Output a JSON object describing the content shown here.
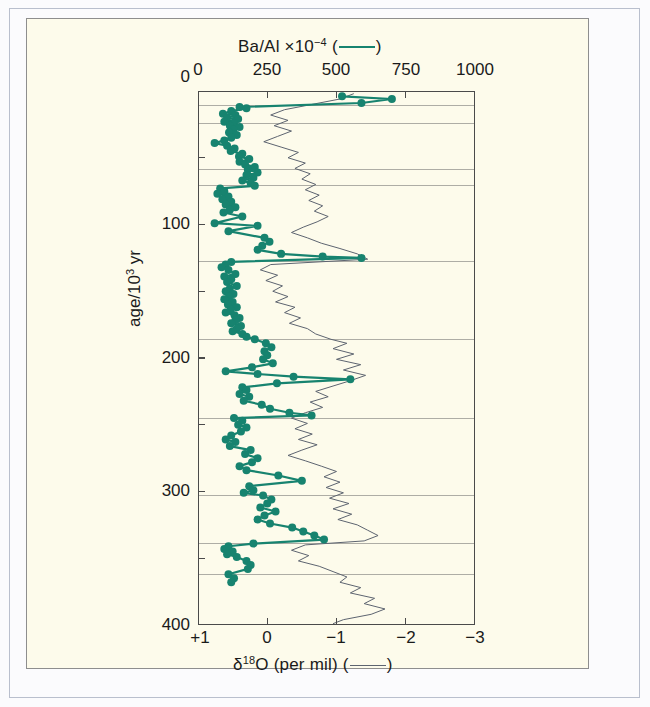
{
  "figure": {
    "background_color": "#fdfbeb",
    "series_color_ba": "#17836f",
    "series_color_d18o": "#5d6470"
  },
  "chart_data": {
    "type": "line",
    "title": "",
    "orientation": "vertical-depth-profile",
    "ylabel": "age/10³ yr",
    "ylim": [
      0,
      400
    ],
    "yticks": [
      0,
      100,
      200,
      300,
      400
    ],
    "yticks_minor": [
      50,
      150,
      250,
      350
    ],
    "ytick_labels": [
      "0",
      "100",
      "200",
      "300",
      "400"
    ],
    "y_inverted": true,
    "grid": "horizontal stage-boundary rules only",
    "legend_position": "axis captions",
    "top_axis": {
      "label_text": "Ba/Al ×10",
      "label_exponent": "−4",
      "label_suffix": "(",
      "label_suffix_end": ")",
      "legend_marker": "teal-line",
      "xlim": [
        0,
        1000
      ],
      "xticks": [
        0,
        250,
        500,
        750,
        1000
      ],
      "xtick_labels": [
        "0",
        "250",
        "500",
        "750",
        "1000"
      ]
    },
    "bottom_axis": {
      "label_delta": "δ",
      "label_exponent": "18",
      "label_element": "O",
      "label_units": "(per mil)",
      "label_suffix": "(",
      "label_suffix_end": ")",
      "legend_marker": "gray-line",
      "xlim": [
        1,
        -3
      ],
      "xticks": [
        1,
        0,
        -1,
        -2,
        -3
      ],
      "xtick_labels": [
        "+1",
        "0",
        "−1",
        "−2",
        "−3"
      ]
    },
    "stage_boundaries_kyr": [
      11,
      24,
      59,
      71,
      128,
      186,
      245,
      303,
      339,
      362
    ],
    "series": [
      {
        "name": "Ba/Al ×10⁻⁴",
        "axis": "top",
        "color": "#17836f",
        "marker": "filled-circle",
        "points": [
          [
            520,
            4
          ],
          [
            700,
            6
          ],
          [
            590,
            9
          ],
          [
            150,
            12
          ],
          [
            175,
            13
          ],
          [
            120,
            15
          ],
          [
            90,
            17
          ],
          [
            135,
            18
          ],
          [
            105,
            20
          ],
          [
            145,
            21
          ],
          [
            95,
            23
          ],
          [
            130,
            24
          ],
          [
            115,
            26
          ],
          [
            150,
            27
          ],
          [
            128,
            29
          ],
          [
            112,
            31
          ],
          [
            140,
            33
          ],
          [
            120,
            35
          ],
          [
            95,
            37
          ],
          [
            60,
            39
          ],
          [
            105,
            41
          ],
          [
            132,
            43
          ],
          [
            118,
            45
          ],
          [
            160,
            47
          ],
          [
            148,
            49
          ],
          [
            185,
            51
          ],
          [
            150,
            53
          ],
          [
            170,
            55
          ],
          [
            205,
            57
          ],
          [
            180,
            59
          ],
          [
            215,
            61
          ],
          [
            175,
            63
          ],
          [
            200,
            65
          ],
          [
            160,
            67
          ],
          [
            190,
            69
          ],
          [
            205,
            71
          ],
          [
            80,
            73
          ],
          [
            95,
            75
          ],
          [
            70,
            77
          ],
          [
            110,
            79
          ],
          [
            88,
            81
          ],
          [
            120,
            83
          ],
          [
            100,
            85
          ],
          [
            135,
            87
          ],
          [
            115,
            89
          ],
          [
            92,
            91
          ],
          [
            160,
            94
          ],
          [
            60,
            99
          ],
          [
            215,
            101
          ],
          [
            110,
            105
          ],
          [
            240,
            110
          ],
          [
            258,
            113
          ],
          [
            232,
            116
          ],
          [
            215,
            119
          ],
          [
            300,
            122
          ],
          [
            450,
            124
          ],
          [
            590,
            125
          ],
          [
            120,
            128
          ],
          [
            100,
            130
          ],
          [
            85,
            132
          ],
          [
            110,
            134
          ],
          [
            135,
            137
          ],
          [
            95,
            139
          ],
          [
            120,
            141
          ],
          [
            105,
            143
          ],
          [
            140,
            146
          ],
          [
            115,
            148
          ],
          [
            100,
            150
          ],
          [
            128,
            152
          ],
          [
            112,
            154
          ],
          [
            95,
            156
          ],
          [
            125,
            158
          ],
          [
            108,
            160
          ],
          [
            140,
            162
          ],
          [
            118,
            164
          ],
          [
            100,
            166
          ],
          [
            132,
            168
          ],
          [
            150,
            170
          ],
          [
            135,
            172
          ],
          [
            120,
            174
          ],
          [
            155,
            176
          ],
          [
            140,
            178
          ],
          [
            125,
            180
          ],
          [
            160,
            182
          ],
          [
            175,
            184
          ],
          [
            205,
            186
          ],
          [
            245,
            189
          ],
          [
            265,
            192
          ],
          [
            240,
            195
          ],
          [
            250,
            198
          ],
          [
            235,
            201
          ],
          [
            270,
            204
          ],
          [
            195,
            207
          ],
          [
            100,
            210
          ],
          [
            215,
            212
          ],
          [
            345,
            214
          ],
          [
            550,
            216
          ],
          [
            285,
            219
          ],
          [
            160,
            222
          ],
          [
            175,
            224
          ],
          [
            150,
            227
          ],
          [
            185,
            229
          ],
          [
            165,
            232
          ],
          [
            230,
            235
          ],
          [
            260,
            238
          ],
          [
            330,
            241
          ],
          [
            410,
            243
          ],
          [
            130,
            245
          ],
          [
            160,
            247
          ],
          [
            145,
            250
          ],
          [
            175,
            252
          ],
          [
            155,
            255
          ],
          [
            120,
            258
          ],
          [
            100,
            261
          ],
          [
            135,
            263
          ],
          [
            115,
            266
          ],
          [
            190,
            269
          ],
          [
            170,
            272
          ],
          [
            215,
            275
          ],
          [
            195,
            278
          ],
          [
            150,
            281
          ],
          [
            175,
            284
          ],
          [
            290,
            288
          ],
          [
            375,
            292
          ],
          [
            185,
            296
          ],
          [
            200,
            299
          ],
          [
            165,
            301
          ],
          [
            235,
            303
          ],
          [
            265,
            306
          ],
          [
            250,
            309
          ],
          [
            225,
            312
          ],
          [
            280,
            315
          ],
          [
            240,
            318
          ],
          [
            215,
            321
          ],
          [
            260,
            324
          ],
          [
            340,
            327
          ],
          [
            380,
            330
          ],
          [
            420,
            333
          ],
          [
            455,
            336
          ],
          [
            200,
            339
          ],
          [
            110,
            341
          ],
          [
            95,
            343
          ],
          [
            125,
            345
          ],
          [
            105,
            347
          ],
          [
            140,
            349
          ],
          [
            175,
            352
          ],
          [
            190,
            355
          ],
          [
            180,
            358
          ],
          [
            110,
            362
          ],
          [
            130,
            365
          ],
          [
            120,
            368
          ]
        ]
      },
      {
        "name": "δ¹⁸O (per mil)",
        "axis": "bottom",
        "color": "#5d6470",
        "marker": "none",
        "points": [
          [
            -1.25,
            2
          ],
          [
            -1.05,
            6
          ],
          [
            -0.65,
            10
          ],
          [
            -0.25,
            14
          ],
          [
            -0.05,
            18
          ],
          [
            -0.3,
            22
          ],
          [
            -0.1,
            26
          ],
          [
            -0.35,
            30
          ],
          [
            -0.15,
            34
          ],
          [
            0.05,
            38
          ],
          [
            -0.2,
            42
          ],
          [
            -0.45,
            46
          ],
          [
            -0.3,
            50
          ],
          [
            -0.55,
            54
          ],
          [
            -0.4,
            58
          ],
          [
            -0.62,
            62
          ],
          [
            -0.5,
            66
          ],
          [
            -0.7,
            70
          ],
          [
            -0.55,
            74
          ],
          [
            -0.75,
            78
          ],
          [
            -0.6,
            82
          ],
          [
            -0.8,
            86
          ],
          [
            -0.68,
            90
          ],
          [
            -0.88,
            94
          ],
          [
            -0.72,
            98
          ],
          [
            -0.52,
            102
          ],
          [
            -0.35,
            106
          ],
          [
            -0.58,
            110
          ],
          [
            -0.78,
            114
          ],
          [
            -1.05,
            118
          ],
          [
            -1.3,
            122
          ],
          [
            -1.45,
            126
          ],
          [
            -0.05,
            130
          ],
          [
            0.1,
            134
          ],
          [
            -0.15,
            138
          ],
          [
            0.02,
            142
          ],
          [
            -0.22,
            146
          ],
          [
            -0.08,
            150
          ],
          [
            -0.3,
            154
          ],
          [
            -0.12,
            158
          ],
          [
            -0.4,
            162
          ],
          [
            -0.25,
            166
          ],
          [
            -0.48,
            170
          ],
          [
            -0.32,
            174
          ],
          [
            -0.58,
            178
          ],
          [
            -0.7,
            182
          ],
          [
            -0.92,
            186
          ],
          [
            -1.15,
            189
          ],
          [
            -0.95,
            193
          ],
          [
            -1.25,
            197
          ],
          [
            -1.0,
            201
          ],
          [
            -1.35,
            205
          ],
          [
            -1.1,
            209
          ],
          [
            -1.42,
            213
          ],
          [
            -1.2,
            217
          ],
          [
            -0.95,
            221
          ],
          [
            -0.7,
            225
          ],
          [
            -0.88,
            229
          ],
          [
            -0.62,
            233
          ],
          [
            -0.8,
            237
          ],
          [
            -0.55,
            241
          ],
          [
            -0.35,
            245
          ],
          [
            -0.58,
            249
          ],
          [
            -0.4,
            253
          ],
          [
            -0.65,
            257
          ],
          [
            -0.45,
            261
          ],
          [
            -0.72,
            265
          ],
          [
            -0.5,
            269
          ],
          [
            -0.3,
            273
          ],
          [
            -0.55,
            277
          ],
          [
            -0.78,
            281
          ],
          [
            -1.0,
            285
          ],
          [
            -0.82,
            289
          ],
          [
            -1.05,
            293
          ],
          [
            -0.85,
            297
          ],
          [
            -1.1,
            301
          ],
          [
            -0.9,
            305
          ],
          [
            -1.18,
            309
          ],
          [
            -0.95,
            313
          ],
          [
            -1.22,
            317
          ],
          [
            -1.02,
            321
          ],
          [
            -1.3,
            325
          ],
          [
            -1.45,
            329
          ],
          [
            -1.6,
            333
          ],
          [
            -1.4,
            337
          ],
          [
            -0.55,
            340
          ],
          [
            -0.35,
            344
          ],
          [
            -0.6,
            348
          ],
          [
            -0.45,
            352
          ],
          [
            -0.75,
            356
          ],
          [
            -0.95,
            360
          ],
          [
            -1.15,
            364
          ],
          [
            -1.05,
            368
          ],
          [
            -1.35,
            372
          ],
          [
            -1.2,
            376
          ],
          [
            -1.55,
            380
          ],
          [
            -1.4,
            384
          ],
          [
            -1.7,
            388
          ],
          [
            -1.5,
            392
          ],
          [
            -1.1,
            396
          ],
          [
            -0.95,
            399
          ]
        ]
      }
    ]
  }
}
